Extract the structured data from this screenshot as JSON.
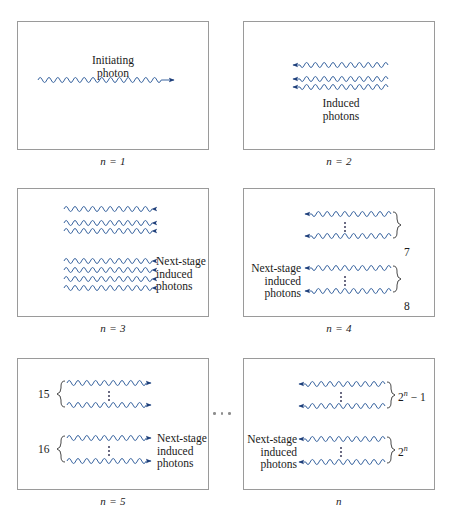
{
  "figure": {
    "title_fragment": "",
    "wave_color": "#2e5c9a",
    "arrow_color": "#1f3f7a",
    "border_color": "#9a9a9a",
    "background": "#ffffff",
    "between_panels_ellipsis": "· · ·"
  },
  "panels": [
    {
      "id": "panel-n1",
      "caption": "n = 1",
      "labels": [
        {
          "name": "initiating-photon-label",
          "lines": [
            "Initiating",
            "photon"
          ]
        }
      ],
      "waves": [
        {
          "direction": "right",
          "count": 1
        }
      ],
      "groups": []
    },
    {
      "id": "panel-n2",
      "caption": "n = 2",
      "labels": [
        {
          "name": "induced-photons-label",
          "lines": [
            "Induced",
            "photons"
          ]
        }
      ],
      "waves": [
        {
          "direction": "left",
          "count": 3
        }
      ],
      "groups": []
    },
    {
      "id": "panel-n3",
      "caption": "n = 3",
      "labels": [
        {
          "name": "next-stage-induced-photons-label",
          "lines": [
            "Next-stage",
            "induced",
            "photons"
          ]
        }
      ],
      "waves": [
        {
          "direction": "right",
          "count": 3
        },
        {
          "direction": "right",
          "count": 4
        }
      ],
      "groups": []
    },
    {
      "id": "panel-n4",
      "caption": "n = 4",
      "labels": [
        {
          "name": "next-stage-induced-photons-label",
          "lines": [
            "Next-stage",
            "induced",
            "photons"
          ]
        }
      ],
      "waves": [
        {
          "direction": "left",
          "count": 2
        },
        {
          "direction": "left",
          "count": 2
        }
      ],
      "groups": [
        {
          "name": "group-count-7",
          "value": "7",
          "side": "right"
        },
        {
          "name": "group-count-8",
          "value": "8",
          "side": "right"
        }
      ]
    },
    {
      "id": "panel-n5",
      "caption": "n = 5",
      "labels": [
        {
          "name": "next-stage-induced-photons-label",
          "lines": [
            "Next-stage",
            "induced",
            "photons"
          ]
        }
      ],
      "waves": [
        {
          "direction": "right",
          "count": 2
        },
        {
          "direction": "right",
          "count": 2
        }
      ],
      "groups": [
        {
          "name": "group-count-15",
          "value": "15",
          "side": "left"
        },
        {
          "name": "group-count-16",
          "value": "16",
          "side": "left"
        }
      ]
    },
    {
      "id": "panel-n",
      "caption": "n",
      "labels": [
        {
          "name": "next-stage-induced-photons-label",
          "lines": [
            "Next-stage",
            "induced",
            "photons"
          ]
        }
      ],
      "waves": [
        {
          "direction": "left",
          "count": 2
        },
        {
          "direction": "left",
          "count": 2
        }
      ],
      "groups": [
        {
          "name": "group-count-2n-minus-1",
          "value_prefix": "2",
          "value_sup": "n",
          "value_suffix": " − 1",
          "side": "right"
        },
        {
          "name": "group-count-2n",
          "value_prefix": "2",
          "value_sup": "n",
          "value_suffix": "",
          "side": "right"
        }
      ]
    }
  ],
  "text": {
    "initiating_line1": "Initiating",
    "initiating_line2": "photon",
    "induced_line1": "Induced",
    "induced_line2": "photons",
    "next_stage_line1": "Next-stage",
    "next_stage_line2": "induced",
    "next_stage_line3": "photons",
    "caption_n1": "n = 1",
    "caption_n2": "n = 2",
    "caption_n3": "n = 3",
    "caption_n4": "n = 4",
    "caption_n5": "n = 5",
    "caption_n": "n",
    "count_7": "7",
    "count_8": "8",
    "count_15": "15",
    "count_16": "16",
    "count_2n_minus_1_base": "2",
    "count_2n_minus_1_tail": " − 1",
    "count_2n_base": "2",
    "count_sup_n": "n"
  }
}
